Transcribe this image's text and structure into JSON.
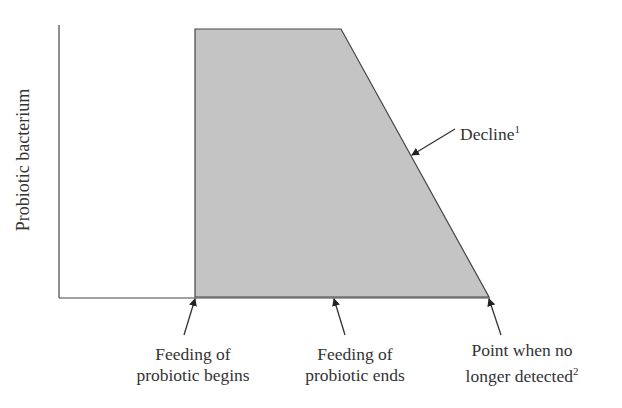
{
  "diagram": {
    "y_axis_label": "Probiotic bacterium",
    "annotations": {
      "decline": {
        "text": "Decline",
        "sup": "1"
      },
      "feeding_begins": {
        "line1": "Feeding of",
        "line2": "probiotic begins"
      },
      "feeding_ends": {
        "line1": "Feeding of",
        "line2": "probiotic ends"
      },
      "no_longer_detected": {
        "line1": "Point when no",
        "line2": "longer detected",
        "sup": "2"
      }
    },
    "colors": {
      "fill": "#c4c4c4",
      "stroke": "#444444"
    }
  }
}
